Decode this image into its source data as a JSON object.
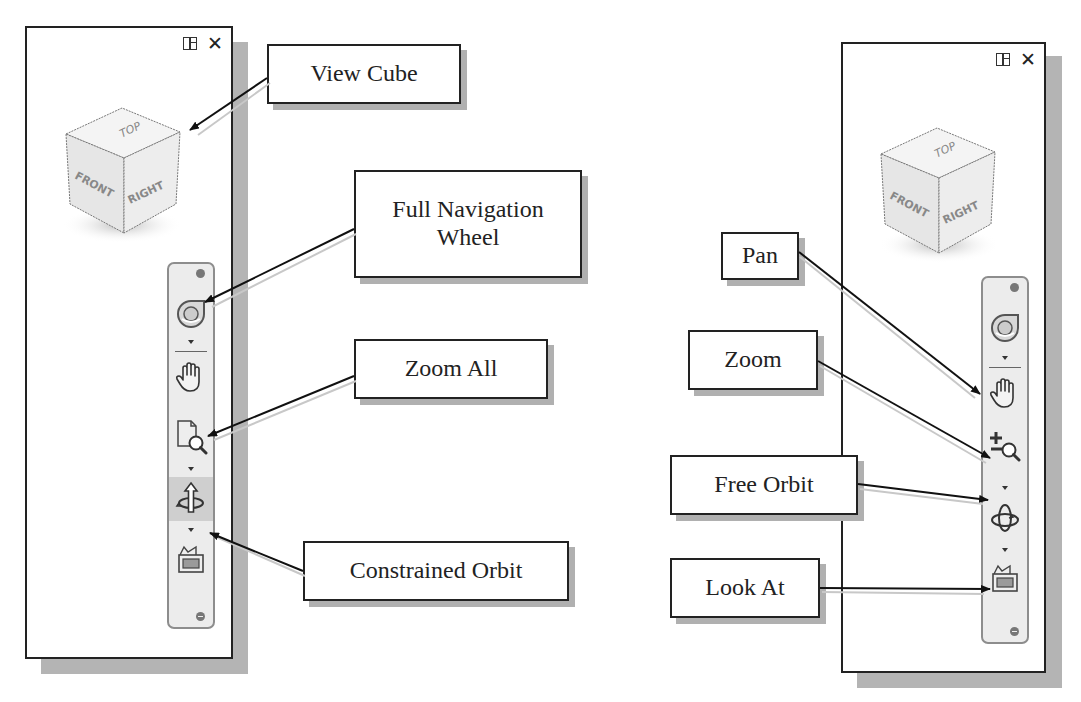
{
  "left_figure": {
    "panel": {
      "close_label": "✕"
    },
    "viewcube": {
      "top": "TOP",
      "front": "FRONT",
      "right": "RIGHT"
    },
    "callouts": [
      {
        "id": "view-cube",
        "label": "View Cube"
      },
      {
        "id": "full-navigation-wheel",
        "label_line1": "Full Navigation",
        "label_line2": "Wheel"
      },
      {
        "id": "zoom-all",
        "label": "Zoom All"
      },
      {
        "id": "constrained-orbit",
        "label": "Constrained Orbit"
      }
    ],
    "navbar_tools": [
      "full-navigation-wheel",
      "pan",
      "zoom-all",
      "constrained-orbit",
      "look-at"
    ],
    "highlighted_tool": "constrained-orbit"
  },
  "right_figure": {
    "panel": {
      "close_label": "✕"
    },
    "viewcube": {
      "top": "TOP",
      "front": "FRONT",
      "right": "RIGHT"
    },
    "callouts": [
      {
        "id": "pan",
        "label": "Pan"
      },
      {
        "id": "zoom",
        "label": "Zoom"
      },
      {
        "id": "free-orbit",
        "label": "Free Orbit"
      },
      {
        "id": "look-at",
        "label": "Look At"
      }
    ],
    "navbar_tools": [
      "full-navigation-wheel",
      "pan",
      "zoom",
      "free-orbit",
      "look-at"
    ]
  },
  "colors": {
    "panel_border": "#222222",
    "shadow": "#b4b4b4",
    "navbar_bg": "#ececec",
    "highlight": "#cfcfcf"
  }
}
